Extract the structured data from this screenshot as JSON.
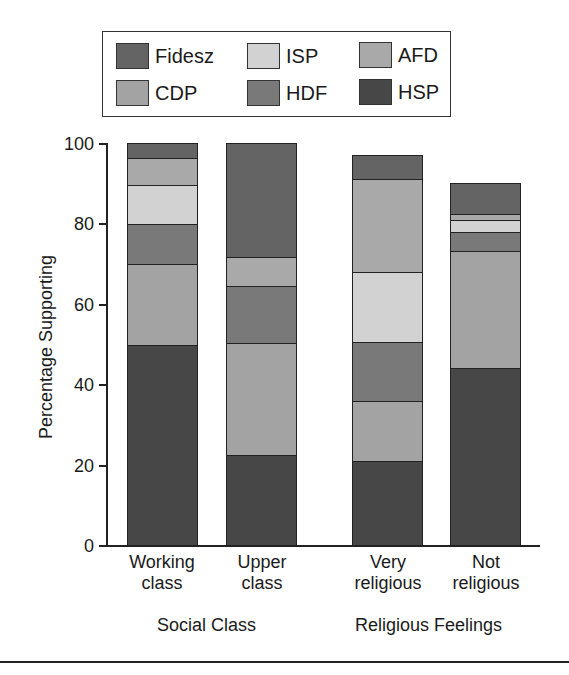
{
  "chart_data": {
    "type": "bar",
    "stacked": true,
    "title": "",
    "xlabel": "",
    "ylabel": "Percentage Supporting",
    "ylim": [
      0,
      100
    ],
    "yticks": [
      0,
      20,
      40,
      60,
      80,
      100
    ],
    "grid": false,
    "legend_position": "top",
    "categories": [
      "Working class",
      "Upper class",
      "Very religious",
      "Not religious"
    ],
    "category_lines": [
      [
        "Working",
        "class"
      ],
      [
        "Upper",
        "class"
      ],
      [
        "Very",
        "religious"
      ],
      [
        "Not",
        "religious"
      ]
    ],
    "groups": [
      {
        "label": "Social Class",
        "categories": [
          "Working class",
          "Upper class"
        ]
      },
      {
        "label": "Religious Feelings",
        "categories": [
          "Very religious",
          "Not religious"
        ]
      }
    ],
    "stack_order_bottom_to_top": [
      "HSP",
      "CDP",
      "HDF",
      "ISP",
      "AFD",
      "Fidesz"
    ],
    "series": [
      {
        "name": "HSP",
        "color": "#474747",
        "values": [
          50.0,
          22.7,
          21.0,
          44.2
        ]
      },
      {
        "name": "CDP",
        "color": "#a3a3a3",
        "values": [
          20.0,
          27.7,
          15.0,
          29.0
        ]
      },
      {
        "name": "HDF",
        "color": "#797979",
        "values": [
          10.0,
          14.1,
          14.7,
          4.6
        ]
      },
      {
        "name": "ISP",
        "color": "#d2d2d2",
        "values": [
          9.5,
          0.0,
          17.2,
          3.1
        ]
      },
      {
        "name": "AFD",
        "color": "#a9a9a9",
        "values": [
          6.7,
          7.2,
          23.2,
          1.5
        ]
      },
      {
        "name": "Fidesz",
        "color": "#646464",
        "values": [
          3.8,
          28.3,
          5.9,
          7.7
        ]
      }
    ],
    "totals": [
      100.0,
      100.0,
      97.0,
      90.1
    ]
  },
  "legend": {
    "items": [
      {
        "name": "Fidesz",
        "color": "#646464"
      },
      {
        "name": "ISP",
        "color": "#d2d2d2"
      },
      {
        "name": "AFD",
        "color": "#a9a9a9"
      },
      {
        "name": "CDP",
        "color": "#a3a3a3"
      },
      {
        "name": "HDF",
        "color": "#797979"
      },
      {
        "name": "HSP",
        "color": "#474747"
      }
    ]
  },
  "axis": {
    "ylabel": "Percentage Supporting",
    "tick_labels": [
      "0",
      "20",
      "40",
      "60",
      "80",
      "100"
    ]
  },
  "labels": {
    "cat0_l1": "Working",
    "cat0_l2": "class",
    "cat1_l1": "Upper",
    "cat1_l2": "class",
    "cat2_l1": "Very",
    "cat2_l2": "religious",
    "cat3_l1": "Not",
    "cat3_l2": "religious",
    "group0": "Social Class",
    "group1": "Religious Feelings"
  }
}
